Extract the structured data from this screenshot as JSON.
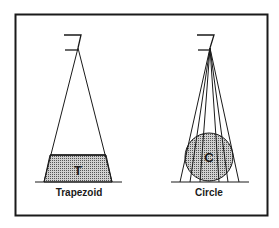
{
  "diagram": {
    "left_panel": {
      "label": "Trapezoid",
      "shape_letter": "T"
    },
    "right_panel": {
      "label": "Circle",
      "shape_letter": "C"
    },
    "colors": {
      "ink": "#1a1a1a",
      "fill_pattern": "#888888",
      "background": "#ffffff"
    }
  }
}
